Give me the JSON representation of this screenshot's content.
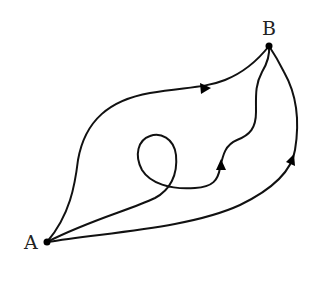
{
  "diagram": {
    "type": "path-diagram",
    "points": [
      {
        "id": "A",
        "label": "A"
      },
      {
        "id": "B",
        "label": "B"
      }
    ],
    "paths": [
      {
        "id": "upper",
        "from": "A",
        "to": "B",
        "shape": "smooth arc above",
        "arrow": true
      },
      {
        "id": "loop",
        "from": "A",
        "to": "B",
        "shape": "loop then wavy",
        "arrow": true
      },
      {
        "id": "lower",
        "from": "A",
        "to": "B",
        "shape": "smooth arc below",
        "arrow": true
      }
    ],
    "colors": {
      "stroke": "#111111",
      "background": "#ffffff"
    }
  }
}
